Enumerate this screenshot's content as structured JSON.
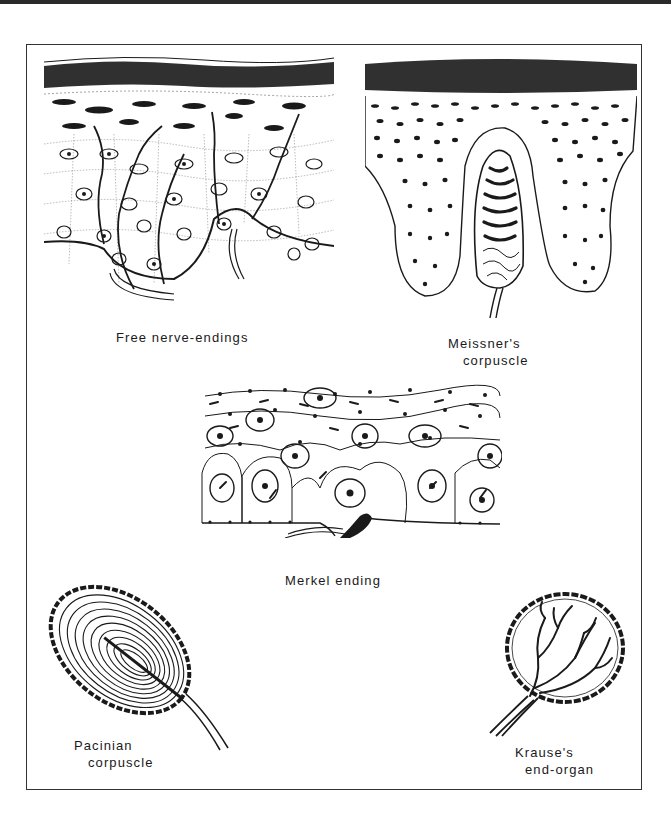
{
  "figure": {
    "panels": [
      {
        "id": "free-nerve-endings",
        "label_lines": [
          "Free nerve-endings"
        ]
      },
      {
        "id": "meissners-corpuscle",
        "label_lines": [
          "Meissner's",
          "corpuscle"
        ]
      },
      {
        "id": "merkel-ending",
        "label_lines": [
          "Merkel ending"
        ]
      },
      {
        "id": "pacinian-corpuscle",
        "label_lines": [
          "Pacinian",
          "corpuscle"
        ]
      },
      {
        "id": "krauses-end-organ",
        "label_lines": [
          "Krause's",
          "end-organ"
        ]
      }
    ]
  },
  "colors": {
    "ink": "#1a1a1a",
    "paper": "#ffffff",
    "border": "#333333"
  }
}
